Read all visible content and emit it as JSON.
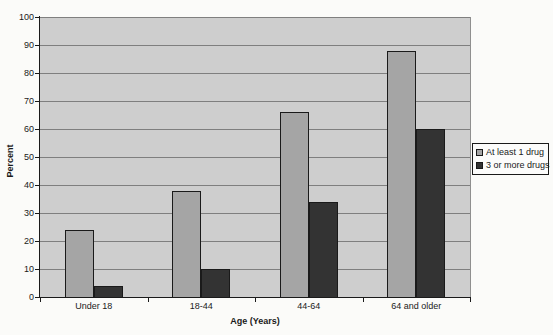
{
  "chart_data": {
    "type": "bar",
    "title": "",
    "categories": [
      "Under 18",
      "18-44",
      "44-64",
      "64 and older"
    ],
    "series": [
      {
        "name": "At least 1 drug",
        "color": "#A5A5A5",
        "values": [
          24,
          38,
          66,
          88
        ]
      },
      {
        "name": "3 or more drugs",
        "color": "#333333",
        "values": [
          4,
          10,
          34,
          60
        ]
      }
    ],
    "xlabel": "Age (Years)",
    "ylabel": "Percent",
    "ylim": [
      0,
      100
    ],
    "yticks": [
      0,
      10,
      20,
      30,
      40,
      50,
      60,
      70,
      80,
      90,
      100
    ],
    "grid": true,
    "legend_position": "right",
    "colors": {
      "page_background": "#FBFBF9",
      "plot_background": "#CECECE",
      "gridline": "#7F7F7F",
      "axis": "#1A1A1A",
      "legend_background": "#FCFCFB",
      "text": "#1A1A1A"
    }
  }
}
